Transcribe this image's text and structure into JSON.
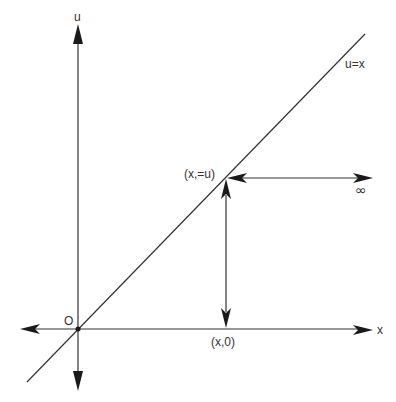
{
  "diagram": {
    "axes": {
      "vertical_label": "u",
      "horizontal_label": "x",
      "origin_label": "O"
    },
    "line": {
      "label": "u=x"
    },
    "points": {
      "intersection_label": "(x,=u)",
      "foot_label": "(x,0)",
      "infinity_label": "∞"
    },
    "colors": {
      "stroke": "#333333",
      "arrowhead": "#1a1a1a",
      "background": "#ffffff"
    }
  }
}
